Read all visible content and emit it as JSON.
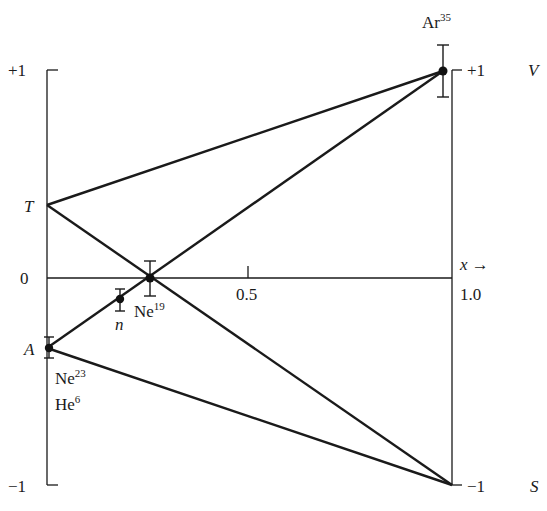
{
  "diagram": {
    "axes": {
      "left": {
        "top_label": "+1",
        "zero_label": "0",
        "bottom_label": "−1",
        "T_label": "T",
        "A_label": "A"
      },
      "right": {
        "top_label": "+1",
        "bottom_label": "−1",
        "V_label": "V",
        "S_label": "S"
      },
      "x_axis": {
        "label": "x →",
        "tick_mid": "0.5",
        "tick_end": "1.0"
      }
    },
    "points": {
      "ar35": {
        "base": "Ar",
        "mass": "35"
      },
      "ne19": {
        "base": "Ne",
        "mass": "19"
      },
      "n": {
        "label": "n"
      },
      "ne23": {
        "base": "Ne",
        "mass": "23"
      },
      "he6": {
        "base": "He",
        "mass": "6"
      }
    }
  }
}
